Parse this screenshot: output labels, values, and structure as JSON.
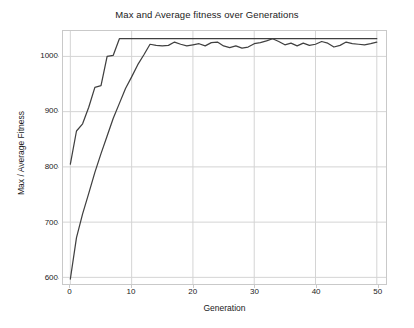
{
  "chart_data": {
    "type": "line",
    "title": "Max and Average fitness over Generations",
    "xlabel": "Generation",
    "ylabel": "Max / Average Fitness",
    "xlim": [
      -1.2,
      51.5
    ],
    "ylim": [
      588,
      1046
    ],
    "xticks": [
      0,
      10,
      20,
      30,
      40,
      50
    ],
    "yticks": [
      600,
      700,
      800,
      900,
      1000
    ],
    "xtick_labels": [
      "0",
      "10",
      "20",
      "30",
      "40",
      "50"
    ],
    "ytick_labels": [
      "600",
      "700",
      "800",
      "900",
      "1000"
    ],
    "grid": true,
    "grid_color": "#d4d4d4",
    "legend": null,
    "legend_position": "none",
    "line_color": "#404040",
    "background_color": "#ffffff",
    "x": [
      0,
      1,
      2,
      3,
      4,
      5,
      6,
      7,
      8,
      9,
      10,
      11,
      12,
      13,
      14,
      15,
      16,
      17,
      18,
      19,
      20,
      21,
      22,
      23,
      24,
      25,
      26,
      27,
      28,
      29,
      30,
      31,
      32,
      33,
      34,
      35,
      36,
      37,
      38,
      39,
      40,
      41,
      42,
      43,
      44,
      45,
      46,
      47,
      48,
      49,
      50
    ],
    "series": [
      {
        "name": "Max fitness",
        "values": [
          805,
          865,
          878,
          908,
          944,
          947,
          1000,
          1002,
          1032,
          1032,
          1032,
          1032,
          1032,
          1032,
          1032,
          1032,
          1032,
          1032,
          1032,
          1032,
          1032,
          1032,
          1032,
          1032,
          1032,
          1032,
          1032,
          1032,
          1032,
          1032,
          1032,
          1032,
          1032,
          1032,
          1032,
          1032,
          1032,
          1032,
          1032,
          1032,
          1032,
          1032,
          1032,
          1032,
          1032,
          1032,
          1032,
          1032,
          1032,
          1032,
          1032
        ]
      },
      {
        "name": "Average fitness",
        "values": [
          597,
          672,
          715,
          752,
          790,
          824,
          856,
          888,
          915,
          942,
          963,
          985,
          1003,
          1022,
          1020,
          1019,
          1020,
          1026,
          1022,
          1019,
          1021,
          1023,
          1019,
          1025,
          1026,
          1019,
          1016,
          1019,
          1015,
          1017,
          1023,
          1025,
          1028,
          1032,
          1027,
          1021,
          1024,
          1019,
          1024,
          1020,
          1022,
          1027,
          1024,
          1017,
          1020,
          1026,
          1023,
          1022,
          1021,
          1023,
          1026
        ]
      }
    ]
  }
}
